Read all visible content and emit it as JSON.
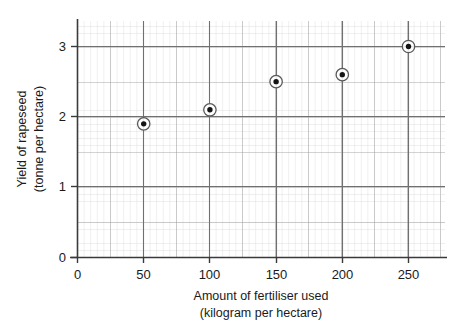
{
  "chart_data": {
    "type": "scatter",
    "title": "",
    "xlabel": "Amount of fertiliser used",
    "xlabel_line2": "(kilogram per hectare)",
    "ylabel": "Yield of rapeseed",
    "ylabel_line2": "(tonne per hectare)",
    "x": [
      50,
      100,
      150,
      200,
      250
    ],
    "values": [
      1.9,
      2.1,
      2.5,
      2.6,
      3.0
    ],
    "series": [
      {
        "name": "Yield of rapeseed",
        "points": [
          {
            "x": 50,
            "y": 1.9
          },
          {
            "x": 100,
            "y": 2.1
          },
          {
            "x": 150,
            "y": 2.5
          },
          {
            "x": 200,
            "y": 2.6
          },
          {
            "x": 250,
            "y": 3.0
          }
        ]
      }
    ],
    "xlim": [
      0,
      272
    ],
    "ylim": [
      0,
      3.37
    ],
    "xticks": [
      0,
      50,
      100,
      150,
      200,
      250
    ],
    "xtick_labels": [
      "0",
      "50",
      "100",
      "150",
      "200",
      "250"
    ],
    "yticks": [
      0,
      1,
      2,
      3
    ],
    "ytick_labels": [
      "0",
      "1",
      "2",
      "3"
    ],
    "grid": true,
    "grid_minor": true,
    "grid_minor_per_major": 5,
    "legend": "none",
    "marker": "circle-with-ring",
    "colors": {
      "marker_fill": "#1a1a1a",
      "marker_ring": "#555555",
      "axis": "#3a3a3a",
      "grid_major": "#9a9a9a",
      "grid_minor": "#cfcfcf",
      "background": "#ffffff",
      "text": "#1a1a1a"
    }
  },
  "axes": {
    "x": {
      "title_line1": "Amount of fertiliser used",
      "title_line2": "(kilogram per hectare)",
      "tick_labels": [
        "0",
        "50",
        "100",
        "150",
        "200",
        "250"
      ]
    },
    "y": {
      "title_line1": "Yield of rapeseed",
      "title_line2": "(tonne per hectare)",
      "tick_labels": [
        "0",
        "1",
        "2",
        "3"
      ]
    }
  }
}
